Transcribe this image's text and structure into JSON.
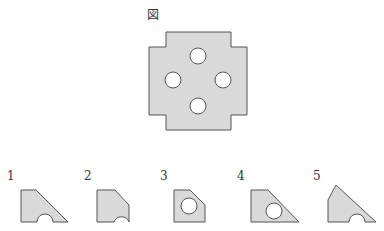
{
  "figure": {
    "label": "図",
    "shape": "cross-shaped plate with four circular holes",
    "fill_color": "#d9d9d9",
    "stroke_color": "#555555",
    "hole_count": 4
  },
  "options": [
    {
      "label": "1",
      "shape": "trapezoid with diagonal right edge and semicircular notch on bottom"
    },
    {
      "label": "2",
      "shape": "pentagon with chamfered top-right corner and semicircular notch at bottom-right"
    },
    {
      "label": "3",
      "shape": "pentagon with chamfered top-right corner and full circular hole"
    },
    {
      "label": "4",
      "shape": "trapezoid with diagonal right edge and full circular hole"
    },
    {
      "label": "5",
      "shape": "triangle-like shape with semicircular notch on bottom"
    }
  ]
}
